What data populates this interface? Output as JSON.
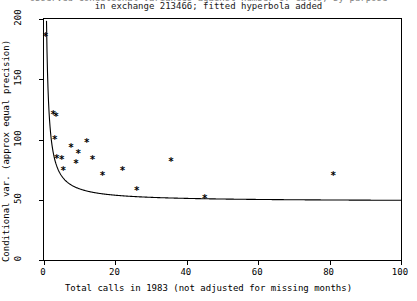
{
  "chart_data": {
    "type": "scatter",
    "title": "in exchange 213466; fitted hyperbola added",
    "title_clipped": "observed conditional variances against number of calls, by purpose",
    "xlabel": "Total calls in 1983 (not adjusted for missing months)",
    "ylabel": "Conditional var. (approx equal precision)",
    "xlim": [
      0,
      100
    ],
    "ylim": [
      0,
      200
    ],
    "xticks": [
      0,
      20,
      40,
      60,
      80,
      100
    ],
    "yticks": [
      0,
      50,
      100,
      150,
      200
    ],
    "xticklabels": [
      "0",
      "20",
      "40",
      "60",
      "80",
      "100"
    ],
    "yticklabels": [
      "0",
      "50",
      "100",
      "150",
      "200"
    ],
    "grid": false,
    "legend": null,
    "marker_symbol": "*",
    "points": [
      {
        "x": 0.4,
        "y": 185
      },
      {
        "x": 2.6,
        "y": 120
      },
      {
        "x": 3.4,
        "y": 119
      },
      {
        "x": 3.0,
        "y": 100
      },
      {
        "x": 3.6,
        "y": 84
      },
      {
        "x": 5.0,
        "y": 83
      },
      {
        "x": 5.4,
        "y": 74
      },
      {
        "x": 7.6,
        "y": 93
      },
      {
        "x": 9.0,
        "y": 80
      },
      {
        "x": 9.6,
        "y": 88
      },
      {
        "x": 12.0,
        "y": 97
      },
      {
        "x": 13.6,
        "y": 83
      },
      {
        "x": 16.4,
        "y": 70
      },
      {
        "x": 22.0,
        "y": 74
      },
      {
        "x": 26.0,
        "y": 57
      },
      {
        "x": 35.6,
        "y": 81
      },
      {
        "x": 45.0,
        "y": 51
      },
      {
        "x": 81.0,
        "y": 70
      }
    ],
    "fit": {
      "label": "fitted hyperbola",
      "form": "y = a + b/x",
      "a": 48.5,
      "b": 105.0
    }
  }
}
